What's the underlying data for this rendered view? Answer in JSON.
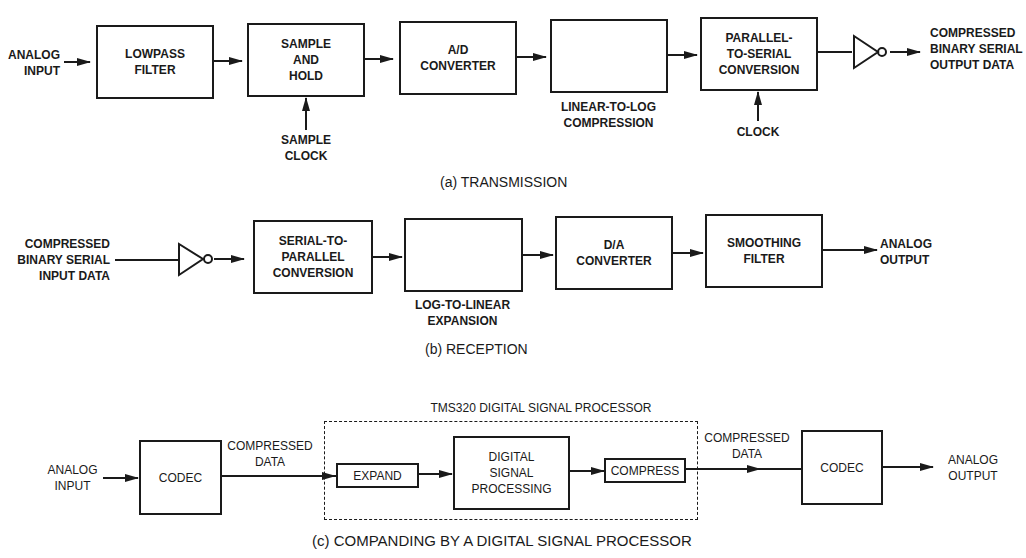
{
  "transmission": {
    "caption": "(a) TRANSMISSION",
    "input_label": "ANALOG\nINPUT",
    "blocks": [
      {
        "label": "LOWPASS\nFILTER"
      },
      {
        "label": "SAMPLE\nAND\nHOLD"
      },
      {
        "label": "A/D\nCONVERTER"
      },
      {
        "label": "",
        "curve": "log"
      },
      {
        "label": "PARALLEL-\nTO-SERIAL\nCONVERSION"
      }
    ],
    "sample_clock_label": "SAMPLE\nCLOCK",
    "compression_label": "LINEAR-TO-LOG\nCOMPRESSION",
    "clock_label": "CLOCK",
    "output_label": "COMPRESSED\nBINARY SERIAL\nOUTPUT DATA"
  },
  "reception": {
    "caption": "(b) RECEPTION",
    "input_label": "COMPRESSED\nBINARY SERIAL\nINPUT DATA",
    "blocks": [
      {
        "label": "SERIAL-TO-\nPARALLEL\nCONVERSION"
      },
      {
        "label": "",
        "curve": "exp"
      },
      {
        "label": "D/A\nCONVERTER"
      },
      {
        "label": "SMOOTHING\nFILTER"
      }
    ],
    "expansion_label": "LOG-TO-LINEAR\nEXPANSION",
    "output_label": "ANALOG\nOUTPUT"
  },
  "companding": {
    "caption": "(c) COMPANDING BY A DIGITAL SIGNAL PROCESSOR",
    "dsp_title": "TMS320 DIGITAL SIGNAL PROCESSOR",
    "input_label": "ANALOG\nINPUT",
    "codec_in": "CODEC",
    "compressed_in_label": "COMPRESSED\nDATA",
    "expand": "EXPAND",
    "dsp_block": "DIGITAL\nSIGNAL\nPROCESSING",
    "compress": "COMPRESS",
    "compressed_out_label": "COMPRESSED\nDATA",
    "codec_out": "CODEC",
    "output_label": "ANALOG\nOUTPUT"
  }
}
